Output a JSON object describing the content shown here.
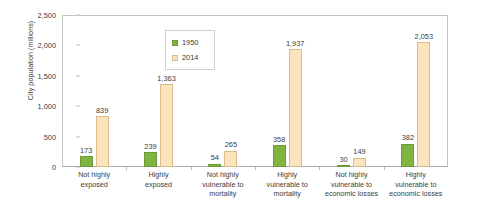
{
  "chart_data": {
    "type": "bar",
    "title": "",
    "xlabel": "",
    "ylabel": "City population (millions)",
    "ylim": [
      0,
      2500
    ],
    "yticks": [
      0,
      500,
      1000,
      1500,
      2000,
      2500
    ],
    "ytick_labels": [
      "0",
      "500",
      "1,000",
      "1,500",
      "2,000",
      "2,500"
    ],
    "grid": false,
    "legend_position": "upper-center-left",
    "categories": [
      "Not highly exposed",
      "Highly exposed",
      "Not highly vulnerable to mortality",
      "Highly vulnerable to mortality",
      "Not highly vulnerable to economic losses",
      "Highly vulnerable to economic losses"
    ],
    "category_lines": [
      [
        "Not highly",
        "exposed"
      ],
      [
        "Highly",
        "exposed"
      ],
      [
        "Not highly",
        "vulnerable to",
        "mortality"
      ],
      [
        "Highly",
        "vulnerable to",
        "mortality"
      ],
      [
        "Not highly",
        "vulnerable to",
        "economic losses"
      ],
      [
        "Highly",
        "vulnerable to",
        "economic losses"
      ]
    ],
    "series": [
      {
        "name": "1950",
        "color": "#80b441",
        "values": [
          173,
          239,
          54,
          358,
          30,
          382
        ],
        "labels": [
          "173",
          "239",
          "54",
          "358",
          "30",
          "382"
        ]
      },
      {
        "name": "2014",
        "color": "#fbe3bc",
        "values": [
          839,
          1363,
          265,
          1937,
          149,
          2053
        ],
        "labels": [
          "839",
          "1,363",
          "265",
          "1,937",
          "149",
          "2,053"
        ]
      }
    ]
  },
  "legend": {
    "entries": [
      {
        "label": "1950"
      },
      {
        "label": "2014"
      }
    ]
  },
  "axis": {
    "y_title": "City population (millions)"
  }
}
